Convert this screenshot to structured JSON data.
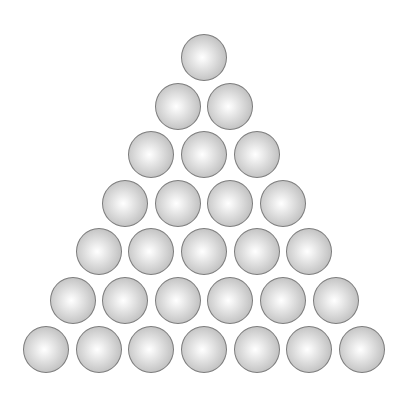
{
  "figure": {
    "rows": 7,
    "total_balls": 28,
    "ball_counts_per_row": [
      1,
      2,
      3,
      4,
      5,
      6,
      7
    ],
    "ball_diameter": 47,
    "horizontal_spacing": 52.6,
    "row_centers_y": [
      57,
      106,
      154,
      203,
      251,
      300,
      349
    ],
    "apex_center_x": 204,
    "colors": {
      "background": "#ffffff",
      "outline": "#7c7c7c",
      "highlight": "#ffffff",
      "shade": "#a2a2a2"
    }
  }
}
